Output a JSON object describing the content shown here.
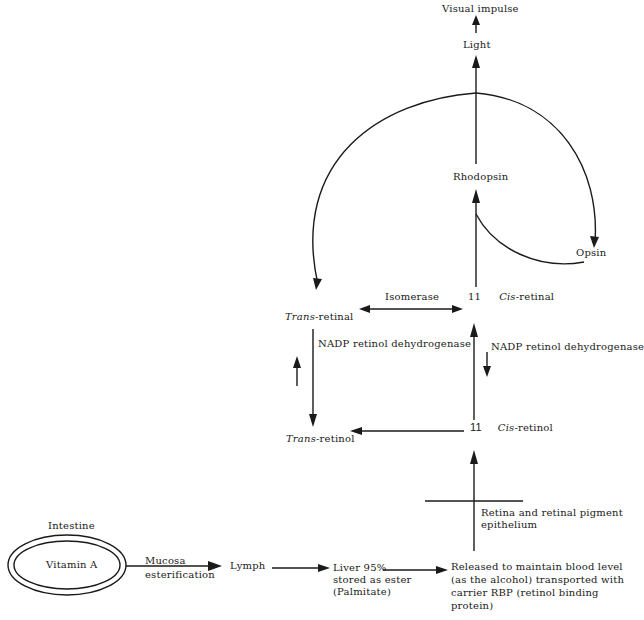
{
  "diagram": {
    "nodes": {
      "visual_impulse": "Visual impulse",
      "light": "Light",
      "rhodopsin": "Rhodopsin",
      "opsin": "Opsin",
      "isomerase": "Isomerase",
      "cis_retinal_num": "11",
      "cis_retinal_italic": "Cis",
      "cis_retinal_rest": "-retinal",
      "trans_retinal_italic": "Trans",
      "trans_retinal_rest": "-retinal",
      "nadp_left": "NADP retinol dehydrogenase",
      "nadp_right": "NADP retinol dehydrogenase",
      "cis_retinol_num": "11",
      "cis_retinol_italic": "Cis",
      "cis_retinol_rest": "-retinol",
      "trans_retinol_italic": "Trans",
      "trans_retinol_rest": "-retinol",
      "retina": "Retina and retinal pigment epithelium",
      "intestine": "Intestine",
      "vitamin_a": "Vitamin A",
      "mucosa": "Mucosa",
      "esterification": "esterification",
      "lymph": "Lymph",
      "liver_line1": "Liver 95%",
      "liver_line2": "stored as ester",
      "liver_line3": "(Palmitate)",
      "released_line1": "Released to maintain blood level",
      "released_line2": "(as the alcohol)  transported with",
      "released_line3": "carrier RBP (retinol binding",
      "released_line4": "protein)"
    },
    "edges": [
      {
        "from": "Vitamin A",
        "to": "Lymph",
        "label": "Mucosa esterification"
      },
      {
        "from": "Lymph",
        "to": "Liver 95%"
      },
      {
        "from": "Liver 95%",
        "to": "Released to maintain blood level"
      },
      {
        "from": "Released to maintain blood level",
        "to": "11 Cis-retinol",
        "label": "Retina and retinal pigment epithelium"
      },
      {
        "from": "11 Cis-retinol",
        "to": "Trans-retinol"
      },
      {
        "from": "11 Cis-retinol",
        "to": "11 Cis-retinal",
        "label": "NADP retinol dehydrogenase"
      },
      {
        "from": "Trans-retinal",
        "to": "Trans-retinol",
        "label": "NADP retinol dehydrogenase"
      },
      {
        "from": "Trans-retinal",
        "to": "11 Cis-retinal",
        "label": "Isomerase",
        "bidirectional": true
      },
      {
        "from": "11 Cis-retinal",
        "to": "Rhodopsin"
      },
      {
        "from": "Opsin",
        "to": "Rhodopsin"
      },
      {
        "from": "Rhodopsin",
        "to": "Light"
      },
      {
        "from": "Rhodopsin",
        "to": "Trans-retinal"
      },
      {
        "from": "Rhodopsin",
        "to": "Opsin"
      },
      {
        "from": "Light",
        "to": "Visual impulse"
      }
    ]
  }
}
